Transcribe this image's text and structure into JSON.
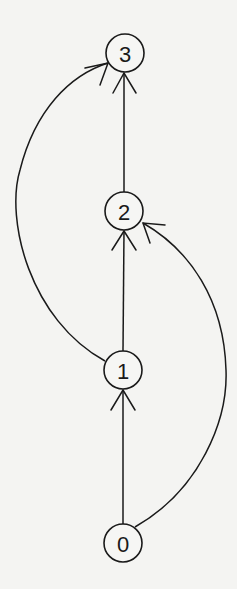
{
  "diagram": {
    "type": "directed-graph",
    "background": "#f4f4f2",
    "stroke_color": "#1a1a1a",
    "nodes": [
      {
        "id": "0",
        "label": "0"
      },
      {
        "id": "1",
        "label": "1"
      },
      {
        "id": "2",
        "label": "2"
      },
      {
        "id": "3",
        "label": "3"
      }
    ],
    "edges": [
      {
        "from": "0",
        "to": "1",
        "style": "straight"
      },
      {
        "from": "1",
        "to": "2",
        "style": "straight"
      },
      {
        "from": "2",
        "to": "3",
        "style": "straight"
      },
      {
        "from": "1",
        "to": "3",
        "style": "curved-left"
      },
      {
        "from": "0",
        "to": "2",
        "style": "curved-right"
      }
    ]
  }
}
